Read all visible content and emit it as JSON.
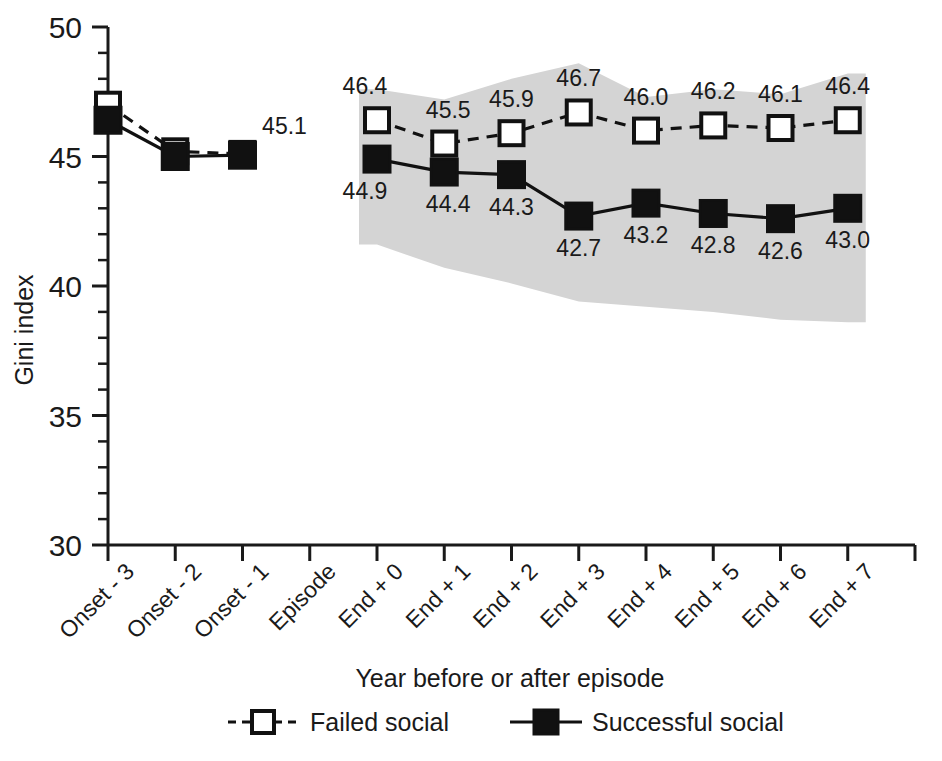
{
  "chart_data": {
    "type": "line",
    "title": "",
    "xlabel": "Year before or after episode",
    "ylabel": "Gini index",
    "ylim": [
      30,
      50
    ],
    "ytick_labels": [
      "50",
      "45",
      "40",
      "35",
      "30"
    ],
    "ytick_values": [
      50,
      45,
      40,
      35,
      30
    ],
    "yminor_step": 1,
    "grid": false,
    "legend_position": "bottom",
    "categories": [
      "Onset - 3",
      "Onset - 2",
      "Onset - 1",
      "Episode",
      "End + 0",
      "End + 1",
      "End + 2",
      "End + 3",
      "End + 4",
      "End + 5",
      "End + 6",
      "End + 7"
    ],
    "series": [
      {
        "name": "Failed social",
        "marker": "open-square",
        "line": "dashed",
        "x": [
          "Onset - 3",
          "Onset - 2",
          "Onset - 1",
          "End + 0",
          "End + 1",
          "End + 2",
          "End + 3",
          "End + 4",
          "End + 5",
          "End + 6",
          "End + 7"
        ],
        "values": [
          47.0,
          45.2,
          45.1,
          46.4,
          45.5,
          45.9,
          46.7,
          46.0,
          46.2,
          46.1,
          46.4
        ],
        "labels": [
          "",
          "",
          "45.1",
          "46.4",
          "45.5",
          "45.9",
          "46.7",
          "46.0",
          "46.2",
          "46.1",
          "46.4"
        ],
        "label_positions": [
          "none",
          "none",
          "above",
          "above",
          "above",
          "above",
          "above",
          "above",
          "above",
          "above",
          "above"
        ]
      },
      {
        "name": "Successful social",
        "marker": "filled-square",
        "line": "solid",
        "x": [
          "Onset - 3",
          "Onset - 2",
          "Onset - 1",
          "End + 0",
          "End + 1",
          "End + 2",
          "End + 3",
          "End + 4",
          "End + 5",
          "End + 6",
          "End + 7"
        ],
        "values": [
          46.4,
          45.0,
          45.05,
          44.9,
          44.4,
          44.3,
          42.7,
          43.2,
          42.8,
          42.6,
          43.0
        ],
        "labels": [
          "",
          "",
          "",
          "44.9",
          "44.4",
          "44.3",
          "42.7",
          "43.2",
          "42.8",
          "42.6",
          "43.0"
        ],
        "label_positions": [
          "none",
          "none",
          "none",
          "below",
          "below",
          "below",
          "below",
          "below",
          "below",
          "below",
          "below"
        ]
      }
    ],
    "confidence_band": {
      "name": "confidence-interval-band",
      "color": "#d4d4d4",
      "x": [
        "End + 0",
        "End + 1",
        "End + 2",
        "End + 3",
        "End + 4",
        "End + 5",
        "End + 6",
        "End + 7"
      ],
      "upper": [
        47.6,
        47.2,
        48.0,
        48.6,
        47.3,
        47.6,
        47.4,
        48.2
      ],
      "lower": [
        41.6,
        40.7,
        40.1,
        39.4,
        39.2,
        39.0,
        38.7,
        38.6
      ]
    },
    "annotations": [
      {
        "text": "45.1",
        "series": "Failed social",
        "x": "Onset - 1"
      },
      {
        "text": "46.4",
        "series": "Failed social",
        "x": "End + 0"
      },
      {
        "text": "45.5",
        "series": "Failed social",
        "x": "End + 1"
      },
      {
        "text": "45.9",
        "series": "Failed social",
        "x": "End + 2"
      },
      {
        "text": "46.7",
        "series": "Failed social",
        "x": "End + 3"
      },
      {
        "text": "46.0",
        "series": "Failed social",
        "x": "End + 4"
      },
      {
        "text": "46.2",
        "series": "Failed social",
        "x": "End + 5"
      },
      {
        "text": "46.1",
        "series": "Failed social",
        "x": "End + 6"
      },
      {
        "text": "46.4",
        "series": "Failed social",
        "x": "End + 7"
      },
      {
        "text": "44.9",
        "series": "Successful social",
        "x": "End + 0"
      },
      {
        "text": "44.4",
        "series": "Successful social",
        "x": "End + 1"
      },
      {
        "text": "44.3",
        "series": "Successful social",
        "x": "End + 2"
      },
      {
        "text": "42.7",
        "series": "Successful social",
        "x": "End + 3"
      },
      {
        "text": "43.2",
        "series": "Successful social",
        "x": "End + 4"
      },
      {
        "text": "42.8",
        "series": "Successful social",
        "x": "End + 5"
      },
      {
        "text": "42.6",
        "series": "Successful social",
        "x": "End + 6"
      },
      {
        "text": "43.0",
        "series": "Successful social",
        "x": "End + 7"
      }
    ],
    "legend": [
      {
        "label": "Failed social",
        "marker": "open-square",
        "line": "dashed",
        "color": "#111111"
      },
      {
        "label": "Successful social",
        "marker": "filled-square",
        "line": "solid",
        "color": "#111111"
      }
    ]
  },
  "axes": {
    "y_title": "Gini index",
    "x_title": "Year before or after episode",
    "y_labels": [
      "50",
      "45",
      "40",
      "35",
      "30"
    ],
    "x_labels": [
      "Onset - 3",
      "Onset - 2",
      "Onset - 1",
      "Episode",
      "End + 0",
      "End + 1",
      "End + 2",
      "End + 3",
      "End + 4",
      "End + 5",
      "End + 6",
      "End + 7"
    ]
  },
  "legend": {
    "items": [
      {
        "label": "Failed social"
      },
      {
        "label": "Successful social"
      }
    ]
  },
  "colors": {
    "band": "#d4d4d4",
    "ink": "#111111",
    "background": "#ffffff"
  }
}
